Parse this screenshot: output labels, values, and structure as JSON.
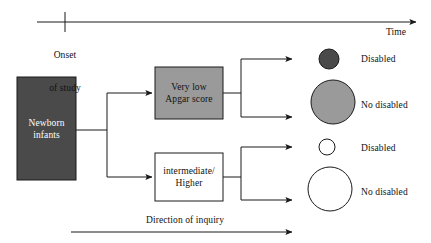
{
  "diagram": {
    "colors": {
      "dark_fill": "#4a4a4a",
      "gray_fill": "#9a9a9a",
      "white_fill": "#ffffff",
      "stroke": "#1a1a1a",
      "text_dark": "#111111",
      "text_light": "#ffffff",
      "background": "#ffffff"
    },
    "timeline": {
      "name": "time-axis",
      "tick_label_line1": "Onset",
      "tick_label_line2": "of study",
      "axis_label": "Time"
    },
    "cohort_box": {
      "line1": "Newborn",
      "line2": "infants",
      "fill": "#4a4a4a",
      "text_color": "#ffffff"
    },
    "exposure_groups": [
      {
        "id": "very-low-apgar",
        "line1": "Very low",
        "line2": "Apgar score",
        "fill": "#9a9a9a",
        "text_color": "#111111"
      },
      {
        "id": "intermediate-higher",
        "line1": "intermediate/",
        "line2": "Higher",
        "fill": "#ffffff",
        "text_color": "#111111"
      }
    ],
    "outcomes": [
      {
        "id": "very-low-disabled",
        "label": "Disabled",
        "fill": "#4a4a4a",
        "radius": 10,
        "group": "very-low-apgar"
      },
      {
        "id": "very-low-no-disabled",
        "label": "No disabled",
        "fill": "#9a9a9a",
        "radius": 22,
        "group": "very-low-apgar"
      },
      {
        "id": "intermediate-disabled",
        "label": "Disabled",
        "fill": "#ffffff",
        "radius": 8,
        "group": "intermediate-higher"
      },
      {
        "id": "intermediate-no-disabled",
        "label": "No disabled",
        "fill": "#ffffff",
        "radius": 22,
        "group": "intermediate-higher"
      }
    ],
    "footer": {
      "direction_label": "Direction of inquiry"
    }
  }
}
